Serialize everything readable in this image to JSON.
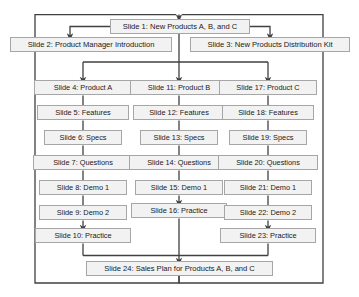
{
  "diagram": {
    "type": "flowchart",
    "box_fill": "#f2f2f2",
    "box_border": "#a6a6a6",
    "connector_color": "#404040",
    "background": "#ffffff"
  },
  "nodes": {
    "slide1": {
      "label": "Slide 1: New Products A, B, and C"
    },
    "slide2": {
      "label": "Slide 2:  Product Manager Introduction"
    },
    "slide3": {
      "label": "Slide 3: New Products Distribution Kit"
    },
    "slide24": {
      "label": "Slide 24: Sales Plan for Products A, B, and C"
    }
  },
  "columns": [
    {
      "name": "product-a",
      "items": [
        {
          "label": "Slide 4: Product A"
        },
        {
          "label": "Slide 5: Features"
        },
        {
          "label": "Slide 6:  Specs"
        },
        {
          "label": "Slide 7: Questions"
        },
        {
          "label": "Slide 8: Demo 1"
        },
        {
          "label": "Slide 9: Demo 2"
        },
        {
          "label": "Slide 10: Practice"
        }
      ]
    },
    {
      "name": "product-b",
      "items": [
        {
          "label": "Slide 11: Product B"
        },
        {
          "label": "Slide 12: Features"
        },
        {
          "label": "Slide 13:  Specs"
        },
        {
          "label": "Slide 14: Questions"
        },
        {
          "label": "Slide 15: Demo 1"
        },
        {
          "label": "Slide 16: Practice"
        }
      ]
    },
    {
      "name": "product-c",
      "items": [
        {
          "label": "Slide 17: Product C"
        },
        {
          "label": "Slide 18: Features"
        },
        {
          "label": "Slide 19:  Specs"
        },
        {
          "label": "Slide 20: Questions"
        },
        {
          "label": "Slide 21: Demo 1"
        },
        {
          "label": "Slide 22: Demo 2"
        },
        {
          "label": "Slide 23: Practice"
        }
      ]
    }
  ]
}
